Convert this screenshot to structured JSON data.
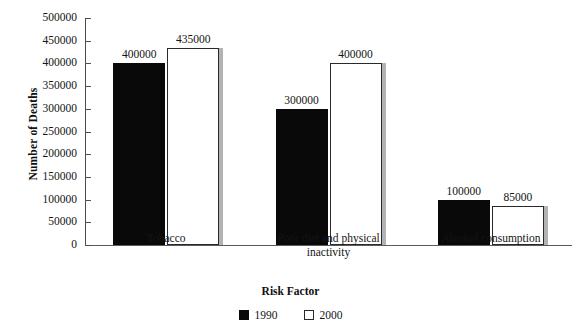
{
  "chart_data": {
    "type": "bar",
    "title": "",
    "xlabel": "Risk Factor",
    "ylabel": "Number of Deaths",
    "categories": [
      "Tobacco",
      "Poor diet and physical inactivity",
      "Alcohol consumption"
    ],
    "series": [
      {
        "name": "1990",
        "values": [
          400000,
          435000,
          300000
        ],
        "color": "#090909"
      },
      {
        "name": "2000",
        "values": [
          435000,
          400000,
          85000
        ],
        "color": "#ffffff"
      }
    ],
    "grouped_values": {
      "Tobacco": {
        "1990": 400000,
        "2000": 435000
      },
      "Poor diet and physical inactivity": {
        "1990": 300000,
        "2000": 400000
      },
      "Alcohol consumption": {
        "1990": 100000,
        "2000": 85000
      }
    },
    "bars": [
      {
        "category": "Tobacco",
        "series": "1990",
        "value": 400000,
        "label": "400000"
      },
      {
        "category": "Tobacco",
        "series": "2000",
        "value": 435000,
        "label": "435000"
      },
      {
        "category": "Poor diet and physical inactivity",
        "series": "1990",
        "value": 300000,
        "label": "300000"
      },
      {
        "category": "Poor diet and physical inactivity",
        "series": "2000",
        "value": 400000,
        "label": "400000"
      },
      {
        "category": "Alcohol consumption",
        "series": "1990",
        "value": 100000,
        "label": "100000"
      },
      {
        "category": "Alcohol consumption",
        "series": "2000",
        "value": 85000,
        "label": "85000"
      }
    ],
    "ylim": [
      0,
      500000
    ],
    "ytick_step": 50000,
    "ytick_labels": [
      "500000",
      "450000",
      "400000",
      "350000",
      "300000",
      "250000",
      "200000",
      "150000",
      "100000",
      "50000",
      "0"
    ],
    "ytick_values": [
      500000,
      450000,
      400000,
      350000,
      300000,
      250000,
      200000,
      150000,
      100000,
      50000,
      0
    ],
    "grid": false,
    "legend_position": "bottom-center",
    "legend_entries": [
      {
        "label": "1990",
        "marker": "filled-square"
      },
      {
        "label": "2000",
        "marker": "hollow-square"
      }
    ],
    "category_label_lines": [
      [
        "Tobacco"
      ],
      [
        "Poor diet and physical",
        "inactivity"
      ],
      [
        "Alcohol consumption"
      ]
    ]
  },
  "colors": {
    "bar_1990": "#090909",
    "bar_2000": "#ffffff",
    "bar_2000_outline": "#2a2a2a",
    "bar_2000_shadow": "#b3b3b3",
    "axis": "#4d4d4d",
    "text": "#141414",
    "background": "#ffffff"
  }
}
